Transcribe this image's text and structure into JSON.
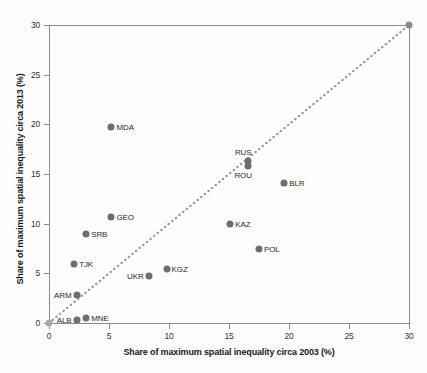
{
  "chart_data": {
    "type": "scatter",
    "title": "",
    "xlabel": "Share of maximum spatial inequality circa 2003 (%)",
    "ylabel": "Share of maximum spatial inequality circa 2013 (%)",
    "xlim": [
      0,
      30
    ],
    "ylim": [
      0,
      30
    ],
    "xticks": [
      0,
      5,
      10,
      15,
      20,
      25,
      30
    ],
    "yticks": [
      0,
      5,
      10,
      15,
      20,
      25,
      30
    ],
    "xticklabels": [
      "0",
      "5",
      "10",
      "15",
      "20",
      "25",
      "30"
    ],
    "yticklabels": [
      "0",
      "5",
      "10",
      "15",
      "20",
      "25",
      "30"
    ],
    "grid": false,
    "legend": null,
    "marker_color": "#6e6e6e",
    "reference_line": {
      "style": "dotted",
      "color": "#9a9a9a",
      "from": [
        0,
        0
      ],
      "to": [
        30,
        30
      ],
      "description": "45-degree parity line"
    },
    "points": [
      {
        "label": "",
        "x": 0.0,
        "y": 0.0,
        "label_pos": "none",
        "size": 7,
        "color": "#a8a8a8"
      },
      {
        "label": "ALB",
        "x": 2.3,
        "y": 0.3,
        "label_pos": "left",
        "size": 7,
        "color": "#6e6e6e"
      },
      {
        "label": "MNE",
        "x": 3.1,
        "y": 0.5,
        "label_pos": "right",
        "size": 7,
        "color": "#6e6e6e"
      },
      {
        "label": "ARM",
        "x": 2.3,
        "y": 2.8,
        "label_pos": "left",
        "size": 7,
        "color": "#6e6e6e"
      },
      {
        "label": "UKR",
        "x": 8.3,
        "y": 4.7,
        "label_pos": "left",
        "size": 7,
        "color": "#6e6e6e"
      },
      {
        "label": "KGZ",
        "x": 9.8,
        "y": 5.4,
        "label_pos": "right",
        "size": 7,
        "color": "#6e6e6e"
      },
      {
        "label": "TJK",
        "x": 2.1,
        "y": 5.9,
        "label_pos": "right",
        "size": 7,
        "color": "#6e6e6e"
      },
      {
        "label": "POL",
        "x": 17.5,
        "y": 7.5,
        "label_pos": "right",
        "size": 7,
        "color": "#6e6e6e"
      },
      {
        "label": "SRB",
        "x": 3.1,
        "y": 9.0,
        "label_pos": "right",
        "size": 7,
        "color": "#6e6e6e"
      },
      {
        "label": "KAZ",
        "x": 15.1,
        "y": 10.0,
        "label_pos": "right",
        "size": 7,
        "color": "#6e6e6e"
      },
      {
        "label": "GEO",
        "x": 5.2,
        "y": 10.7,
        "label_pos": "right",
        "size": 7,
        "color": "#6e6e6e"
      },
      {
        "label": "BLR",
        "x": 19.6,
        "y": 14.1,
        "label_pos": "right",
        "size": 7,
        "color": "#6e6e6e"
      },
      {
        "label": "ROU",
        "x": 16.6,
        "y": 15.8,
        "label_pos": "below",
        "size": 7,
        "color": "#6e6e6e"
      },
      {
        "label": "RUS",
        "x": 16.6,
        "y": 16.3,
        "label_pos": "above",
        "size": 7,
        "color": "#6e6e6e"
      },
      {
        "label": "MDA",
        "x": 5.2,
        "y": 19.7,
        "label_pos": "right",
        "size": 7,
        "color": "#6e6e6e"
      },
      {
        "label": "",
        "x": 30.0,
        "y": 30.0,
        "label_pos": "none",
        "size": 7,
        "color": "#8a8a8a"
      }
    ]
  }
}
